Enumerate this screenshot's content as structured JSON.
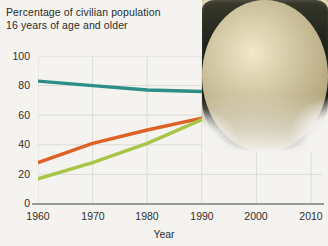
{
  "chart_data": {
    "type": "line",
    "title": "Percentage of civilian population 16 years of age and older",
    "title_lines": [
      "Percentage of civilian population",
      "16 years of age and older"
    ],
    "xlabel": "Year",
    "ylabel": "",
    "x": [
      1960,
      1970,
      1980,
      1990,
      2000,
      2010
    ],
    "xlim": [
      1960,
      2012
    ],
    "ylim": [
      0,
      100
    ],
    "yticks": [
      0,
      20,
      40,
      60,
      80,
      100
    ],
    "xticks": [
      1960,
      1970,
      1980,
      1990,
      2000,
      2010
    ],
    "xtick_labels": [
      "1960",
      "1970",
      "1980",
      "1990",
      "2000",
      "2010"
    ],
    "ytick_labels": [
      "0",
      "20",
      "40",
      "60",
      "80",
      "100"
    ],
    "grid": true,
    "legend": "none",
    "series": [
      {
        "name": "men",
        "color": "#2c8e85",
        "values": [
          83,
          80,
          77,
          76,
          75,
          72
        ]
      },
      {
        "name": "all",
        "color": "#de6226",
        "values": [
          28,
          41,
          50,
          58,
          60,
          60
        ]
      },
      {
        "name": "women",
        "color": "#a9c548",
        "values": [
          17,
          28,
          41,
          57,
          60,
          60
        ]
      }
    ]
  },
  "axes": {
    "y_ticks": [
      "100",
      "80",
      "60",
      "40",
      "20",
      "0"
    ],
    "x_ticks": [
      "1960",
      "1970",
      "1980",
      "1990",
      "2000",
      "2010"
    ],
    "x_title": "Year"
  },
  "photo": {
    "name": "coin-purse-photo",
    "description": "coin purse with coins"
  },
  "colors": {
    "teal": "#2c8e85",
    "orange": "#de6226",
    "green": "#a9c548",
    "background": "#f4f3ef",
    "grid": "#dcdcd6",
    "axis": "#9a9a95",
    "text": "#2b2b2b"
  }
}
